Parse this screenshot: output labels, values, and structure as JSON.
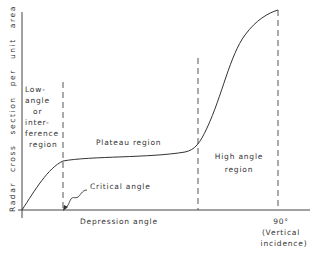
{
  "diagram": {
    "y_axis_label": "Radar cross section per unit area σ°",
    "x_axis_label": "Depression angle",
    "x_end_tick": "90°",
    "x_end_note_line1": "(Vertical",
    "x_end_note_line2": "incidence)",
    "regions": [
      {
        "id": "low-angle",
        "lines": [
          "Low-",
          "angle",
          "or",
          "inter-",
          "ference",
          "region"
        ]
      },
      {
        "id": "plateau",
        "label": "Plateau region"
      },
      {
        "id": "high-angle",
        "lines": [
          "High angle",
          "region"
        ]
      }
    ],
    "annotation": {
      "label": "Critical angle"
    },
    "line_color": "#333333"
  }
}
